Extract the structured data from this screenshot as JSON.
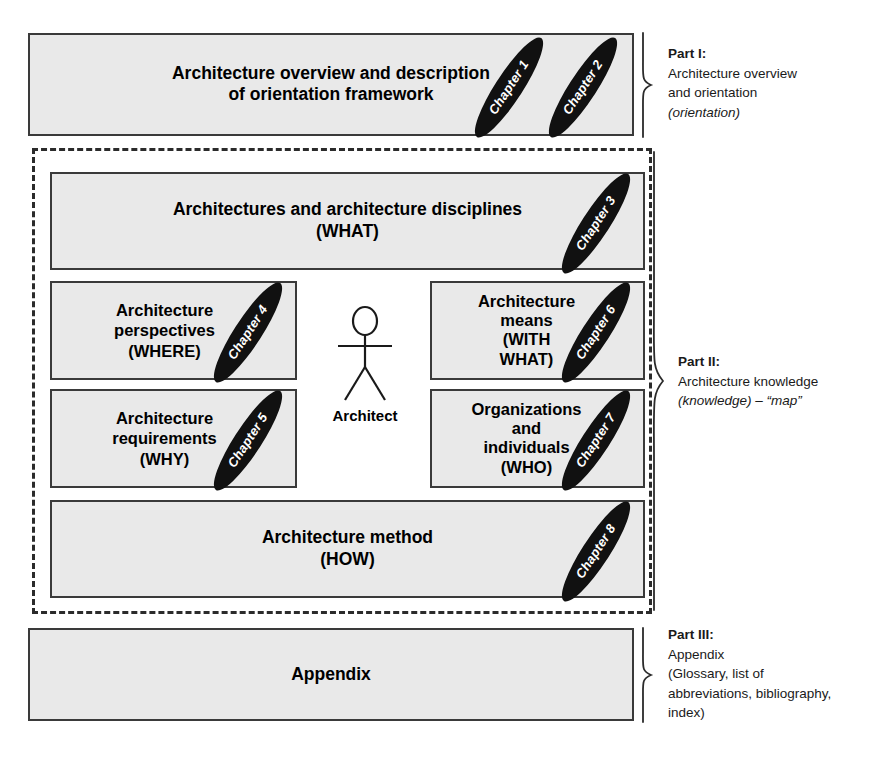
{
  "diagram": {
    "colors": {
      "box_fill": "#e9e9e9",
      "box_border": "#3a3a3a",
      "badge_fill": "#111111",
      "badge_text": "#ffffff",
      "dashed_border": "#2b2b2b"
    }
  },
  "part1": {
    "box_text_line1": "Architecture overview and description",
    "box_text_line2": "of orientation framework",
    "chapters": [
      {
        "label": "Chapter 1"
      },
      {
        "label": "Chapter 2"
      }
    ],
    "note": {
      "title": "Part I:",
      "line1": "Architecture overview",
      "line2": "and orientation",
      "line3": "(orientation)"
    }
  },
  "part2": {
    "note": {
      "title": "Part II:",
      "line1": "Architecture knowledge",
      "line2": "(knowledge) – “map”"
    },
    "boxes": [
      {
        "id": "what",
        "lines": [
          "Architectures and architecture disciplines",
          "(WHAT)"
        ],
        "chapter": "Chapter 3"
      },
      {
        "id": "where",
        "lines": [
          "Architecture",
          "perspectives",
          "(WHERE)"
        ],
        "chapter": "Chapter 4"
      },
      {
        "id": "with-what",
        "lines": [
          "Architecture",
          "means",
          "(WITH",
          "WHAT)"
        ],
        "chapter": "Chapter 6"
      },
      {
        "id": "why",
        "lines": [
          "Architecture",
          "requirements",
          "(WHY)"
        ],
        "chapter": "Chapter 5"
      },
      {
        "id": "who",
        "lines": [
          "Organizations",
          "and",
          "individuals",
          "(WHO)"
        ],
        "chapter": "Chapter 7"
      },
      {
        "id": "how",
        "lines": [
          "Architecture method",
          "(HOW)"
        ],
        "chapter": "Chapter 8"
      }
    ],
    "architect_label": "Architect"
  },
  "part3": {
    "box_text": "Appendix",
    "note": {
      "title": "Part III:",
      "line1": "Appendix",
      "line2": "(Glossary, list of",
      "line3": "abbreviations, bibliography,",
      "line4": "index)"
    }
  }
}
